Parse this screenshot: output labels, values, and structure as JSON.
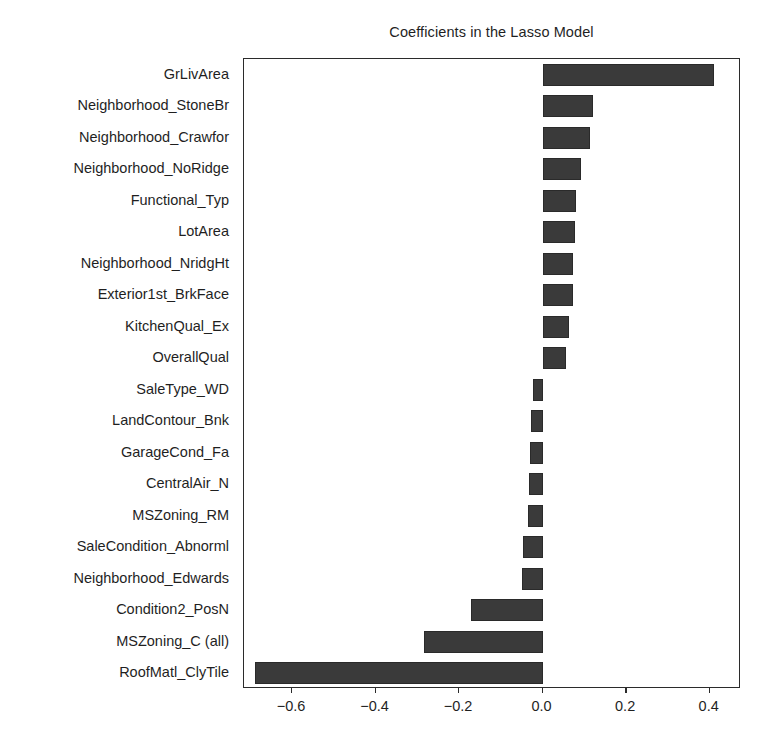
{
  "chart": {
    "title": "Coefficients in the Lasso Model",
    "xlabel": "",
    "ylabel": ""
  },
  "axis": {
    "xticks": [
      "−0.6",
      "−0.4",
      "−0.2",
      "0.0",
      "0.2",
      "0.4"
    ],
    "xtick_values": [
      -0.6,
      -0.4,
      -0.2,
      0.0,
      0.2,
      0.4
    ]
  },
  "style": {
    "bar_color": "#3a3a3a",
    "bar_edge_color": "#2a2a2a",
    "frame_color": "#2b2b2b",
    "background": "#ffffff",
    "text_color": "#1f1f1f"
  },
  "chart_data": {
    "type": "bar",
    "orientation": "horizontal",
    "title": "Coefficients in the Lasso Model",
    "xlabel": "",
    "ylabel": "",
    "xlim": [
      -0.715,
      0.475
    ],
    "grid": false,
    "legend": null,
    "categories": [
      "GrLivArea",
      "Neighborhood_StoneBr",
      "Neighborhood_Crawfor",
      "Neighborhood_NoRidge",
      "Functional_Typ",
      "LotArea",
      "Neighborhood_NridgHt",
      "Exterior1st_BrkFace",
      "KitchenQual_Ex",
      "OverallQual",
      "SaleType_WD",
      "LandContour_Bnk",
      "GarageCond_Fa",
      "CentralAir_N",
      "MSZoning_RM",
      "SaleCondition_Abnorml",
      "Neighborhood_Edwards",
      "Condition2_PosN",
      "MSZoning_C (all)",
      "RoofMatl_ClyTile"
    ],
    "values": [
      0.41,
      0.12,
      0.113,
      0.092,
      0.08,
      0.078,
      0.073,
      0.072,
      0.064,
      0.055,
      -0.024,
      -0.028,
      -0.03,
      -0.032,
      -0.036,
      -0.046,
      -0.05,
      -0.171,
      -0.283,
      -0.688
    ]
  }
}
